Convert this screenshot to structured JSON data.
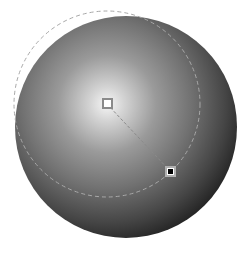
{
  "gradient_editor": {
    "type": "radial",
    "sphere": {
      "cx": 126,
      "cy": 127,
      "r": 111
    },
    "gradient_center": {
      "cx": 107,
      "cy": 104
    },
    "radius_guide": {
      "cx": 107,
      "cy": 104,
      "r": 93
    },
    "stops": [
      {
        "name": "start",
        "color": "#ffffff",
        "x": 107,
        "y": 104
      },
      {
        "name": "end",
        "color": "#000000",
        "x": 171,
        "y": 172
      }
    ],
    "colors": {
      "highlight": "#f4f4f4",
      "mid": "#8c8c8c",
      "shadow": "#2a2a2a",
      "guide": "#9a9a9a",
      "handle_border": "#8a8a8a"
    }
  }
}
